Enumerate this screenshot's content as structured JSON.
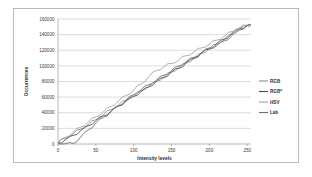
{
  "chart_data": {
    "type": "line",
    "title": "",
    "xlabel": "Intensity levels",
    "ylabel": "Occurrences",
    "xlim": [
      0,
      255
    ],
    "ylim": [
      0,
      160000
    ],
    "grid": true,
    "legend_position": "right",
    "xticks": [
      "0",
      "50",
      "100",
      "150",
      "200",
      "250"
    ],
    "xtick_values": [
      0,
      50,
      100,
      150,
      200,
      250
    ],
    "yticks": [
      "0",
      "20000",
      "40000",
      "60000",
      "80000",
      "100000",
      "120000",
      "140000",
      "160000"
    ],
    "ytick_values": [
      0,
      20000,
      40000,
      60000,
      80000,
      100000,
      120000,
      140000,
      160000
    ],
    "x": [
      0,
      10,
      20,
      30,
      40,
      50,
      60,
      70,
      80,
      90,
      100,
      110,
      120,
      130,
      140,
      150,
      160,
      170,
      180,
      190,
      200,
      210,
      220,
      230,
      240,
      250,
      255
    ],
    "series": [
      {
        "name": "RGB",
        "color": "#8c8c8c",
        "values": [
          1500,
          7000,
          13000,
          19000,
          25000,
          31000,
          37500,
          44000,
          50000,
          56000,
          62000,
          68000,
          74000,
          80000,
          86000,
          92000,
          98000,
          104000,
          110000,
          116000,
          122000,
          128000,
          134000,
          141000,
          147000,
          151500,
          152000
        ]
      },
      {
        "name": "RGB*",
        "color": "#4a4a4a",
        "values": [
          1200,
          5500,
          11000,
          17000,
          23500,
          30000,
          36000,
          42000,
          48500,
          55000,
          61000,
          67500,
          73000,
          80500,
          85000,
          92500,
          97000,
          104500,
          109500,
          117000,
          121500,
          129000,
          134000,
          142000,
          148000,
          151800,
          152000
        ]
      },
      {
        "name": "HSV",
        "color": "#a0a0a0",
        "values": [
          2000,
          8500,
          15000,
          21500,
          28000,
          34500,
          41000,
          48000,
          55000,
          62000,
          69000,
          77000,
          86000,
          94000,
          99000,
          103000,
          108000,
          113000,
          118000,
          123000,
          128000,
          133000,
          138000,
          144000,
          149000,
          151900,
          152000
        ]
      },
      {
        "name": "Lab",
        "color": "#6e6e6e",
        "values": [
          300,
          400,
          600,
          9000,
          18000,
          27000,
          34000,
          41500,
          49000,
          56500,
          63000,
          70000,
          76000,
          82000,
          88000,
          94000,
          100000,
          106000,
          111000,
          117000,
          123000,
          126000,
          132000,
          139000,
          146000,
          151600,
          152000
        ]
      }
    ]
  },
  "legend": {
    "items": [
      {
        "label": "RGB"
      },
      {
        "label": "RGB*"
      },
      {
        "label": "HSV"
      },
      {
        "label": "Lab"
      }
    ]
  }
}
